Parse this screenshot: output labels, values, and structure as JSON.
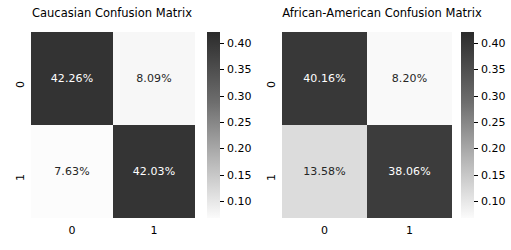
{
  "figure": {
    "background": "#ffffff",
    "colormap": "Greys"
  },
  "panels": [
    {
      "title": "Caucasian Confusion Matrix",
      "xtick_labels": [
        "0",
        "1"
      ],
      "ytick_labels": [
        "0",
        "1"
      ],
      "cells": [
        {
          "label": "42.26%",
          "value": 0.4226,
          "bg": "#333333",
          "fg": "#ffffff"
        },
        {
          "label": "8.09%",
          "value": 0.0809,
          "bg": "#f7f7f7",
          "fg": "#262626"
        },
        {
          "label": "7.63%",
          "value": 0.0763,
          "bg": "#fcfcfc",
          "fg": "#262626"
        },
        {
          "label": "42.03%",
          "value": 0.4203,
          "bg": "#343434",
          "fg": "#ffffff"
        }
      ],
      "colorbar": {
        "ticks": [
          "0.40",
          "0.35",
          "0.30",
          "0.25",
          "0.20",
          "0.15",
          "0.10"
        ],
        "tick_values": [
          0.4,
          0.35,
          0.3,
          0.25,
          0.2,
          0.15,
          0.1
        ],
        "top_color": "#2b2b2b",
        "bottom_color": "#fbfbfb"
      }
    },
    {
      "title": "African-American Confusion Matrix",
      "xtick_labels": [
        "0",
        "1"
      ],
      "ytick_labels": [
        "0",
        "1"
      ],
      "cells": [
        {
          "label": "40.16%",
          "value": 0.4016,
          "bg": "#383838",
          "fg": "#ffffff"
        },
        {
          "label": "8.20%",
          "value": 0.082,
          "bg": "#f9f9f9",
          "fg": "#262626"
        },
        {
          "label": "13.58%",
          "value": 0.1358,
          "bg": "#dcdcdc",
          "fg": "#262626"
        },
        {
          "label": "38.06%",
          "value": 0.3806,
          "bg": "#3c3c3c",
          "fg": "#ffffff"
        }
      ],
      "colorbar": {
        "ticks": [
          "0.40",
          "0.35",
          "0.30",
          "0.25",
          "0.20",
          "0.15",
          "0.10"
        ],
        "tick_values": [
          0.4,
          0.35,
          0.3,
          0.25,
          0.2,
          0.15,
          0.1
        ],
        "top_color": "#2b2b2b",
        "bottom_color": "#fbfbfb"
      }
    }
  ],
  "chart_data": [
    {
      "type": "heatmap",
      "title": "Caucasian Confusion Matrix",
      "xlabel": "",
      "ylabel": "",
      "x_categories": [
        "0",
        "1"
      ],
      "y_categories": [
        "0",
        "1"
      ],
      "values": [
        [
          0.4226,
          0.0809
        ],
        [
          0.0763,
          0.4203
        ]
      ],
      "annotations": [
        [
          "42.26%",
          "8.09%"
        ],
        [
          "7.63%",
          "42.03%"
        ]
      ],
      "colormap": "Greys",
      "colorbar_range": [
        0.0763,
        0.4226
      ],
      "colorbar_ticks": [
        0.1,
        0.15,
        0.2,
        0.25,
        0.3,
        0.35,
        0.4
      ],
      "grid": false,
      "legend": "colorbar-right"
    },
    {
      "type": "heatmap",
      "title": "African-American Confusion Matrix",
      "xlabel": "",
      "ylabel": "",
      "x_categories": [
        "0",
        "1"
      ],
      "y_categories": [
        "0",
        "1"
      ],
      "values": [
        [
          0.4016,
          0.082
        ],
        [
          0.1358,
          0.3806
        ]
      ],
      "annotations": [
        [
          "40.16%",
          "8.20%"
        ],
        [
          "13.58%",
          "38.06%"
        ]
      ],
      "colormap": "Greys",
      "colorbar_range": [
        0.082,
        0.4016
      ],
      "colorbar_ticks": [
        0.1,
        0.15,
        0.2,
        0.25,
        0.3,
        0.35,
        0.4
      ],
      "grid": false,
      "legend": "colorbar-right"
    }
  ]
}
